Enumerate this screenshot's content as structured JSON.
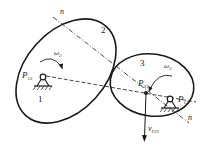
{
  "diagram": {
    "colors": {
      "stroke": "#1a1a1a",
      "background": "#ffffff"
    },
    "links": [
      {
        "id": "link-1",
        "label": "1"
      },
      {
        "id": "link-2",
        "label": "2"
      },
      {
        "id": "link-3",
        "label": "3"
      }
    ],
    "points": {
      "p12": {
        "label": "P",
        "sub": "12"
      },
      "p13": {
        "label": "P",
        "sub": "13"
      },
      "p23": {
        "label": "P",
        "sub": "23"
      }
    },
    "angular_velocities": {
      "omega2": {
        "label": "ω",
        "sub": "2"
      },
      "omega3": {
        "label": "ω",
        "sub": "3"
      }
    },
    "normal_line": {
      "label_top": "n",
      "label_bottom": "n"
    },
    "velocity": {
      "label": "v",
      "sub": "P23"
    }
  }
}
